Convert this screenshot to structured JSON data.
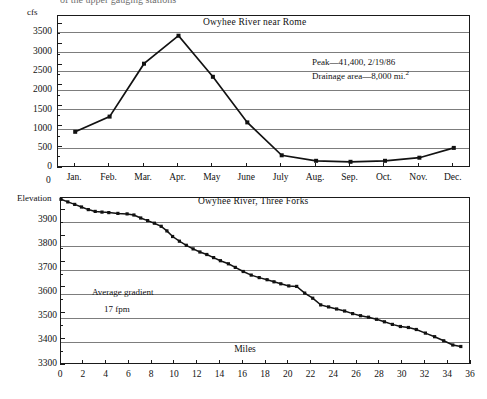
{
  "page": {
    "clipped_header_text": "of the upper gauging stations"
  },
  "charts": [
    {
      "id": "owyhee-near-rome",
      "title": "Owyhee River near Rome",
      "y_unit_label": "cfs",
      "x_origin_label": "0",
      "annotations": [
        "Peak—41,400, 2/19/86",
        "Drainage area—8,000 mi."
      ],
      "annotation_superscript": "2",
      "y_ticks": [
        "0",
        "500",
        "1000",
        "1500",
        "2000",
        "2500",
        "3000",
        "3500"
      ],
      "x_ticks": [
        "Jan.",
        "Feb.",
        "Mar.",
        "Apr.",
        "May",
        "June",
        "July",
        "Aug.",
        "Sep.",
        "Oct.",
        "Nov.",
        "Dec."
      ]
    },
    {
      "id": "owyhee-three-forks",
      "title": "Owyhee River, Three Forks",
      "y_unit_label": "Elevation",
      "x_axis_label": "Miles",
      "annotations": [
        "Average gradient",
        "17 fpm"
      ],
      "y_ticks": [
        "3300",
        "3400",
        "3500",
        "3600",
        "3700",
        "3800",
        "3900"
      ],
      "x_ticks": [
        "0",
        "2",
        "4",
        "6",
        "8",
        "10",
        "12",
        "14",
        "16",
        "18",
        "20",
        "22",
        "24",
        "26",
        "28",
        "30",
        "32",
        "34",
        "36"
      ]
    }
  ],
  "chart_data": [
    {
      "type": "line",
      "title": "Owyhee River near Rome",
      "xlabel": "",
      "ylabel": "cfs",
      "ylim": [
        0,
        3700
      ],
      "grid": true,
      "legend": "none",
      "categories": [
        "Jan.",
        "Feb.",
        "Mar.",
        "Apr.",
        "May",
        "June",
        "July",
        "Aug.",
        "Sep.",
        "Oct.",
        "Nov.",
        "Dec."
      ],
      "values": [
        880,
        1250,
        2540,
        3220,
        2220,
        1110,
        310,
        175,
        150,
        175,
        250,
        490
      ],
      "annotations": [
        "Peak—41,400, 2/19/86",
        "Drainage area—8,000 mi.²"
      ]
    },
    {
      "type": "line",
      "title": "Owyhee River, Three Forks",
      "xlabel": "Miles",
      "ylabel": "Elevation",
      "xlim": [
        0,
        36
      ],
      "ylim": [
        3300,
        3950
      ],
      "grid": true,
      "legend": "none",
      "x": [
        0,
        0.6,
        1.2,
        1.8,
        2.4,
        3.0,
        3.6,
        4.2,
        5.0,
        5.8,
        6.4,
        7.0,
        7.6,
        8.2,
        8.8,
        9.3,
        9.8,
        10.4,
        11.0,
        11.6,
        12.2,
        12.8,
        13.4,
        14.0,
        14.7,
        15.3,
        16.0,
        16.7,
        17.4,
        18.1,
        18.7,
        19.3,
        20.0,
        20.7,
        21.4,
        22.1,
        22.8,
        23.5,
        24.2,
        24.9,
        25.6,
        26.3,
        27.0,
        27.7,
        28.4,
        29.1,
        29.8,
        30.5,
        31.2,
        32.0,
        32.8,
        33.6,
        34.4,
        35.1
      ],
      "y": [
        3945,
        3935,
        3925,
        3915,
        3905,
        3898,
        3895,
        3893,
        3890,
        3888,
        3884,
        3872,
        3862,
        3852,
        3840,
        3822,
        3800,
        3782,
        3766,
        3752,
        3740,
        3730,
        3718,
        3706,
        3694,
        3680,
        3664,
        3650,
        3640,
        3632,
        3624,
        3616,
        3608,
        3606,
        3580,
        3560,
        3534,
        3526,
        3518,
        3510,
        3500,
        3492,
        3486,
        3478,
        3468,
        3458,
        3450,
        3446,
        3438,
        3424,
        3410,
        3394,
        3378,
        3372
      ],
      "annotations": [
        "Average gradient",
        "17 fpm"
      ]
    }
  ]
}
